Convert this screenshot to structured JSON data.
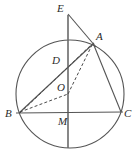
{
  "figure": {
    "type": "euclidean-geometry-diagram",
    "canvas": {
      "width": 136,
      "height": 164
    },
    "stroke_color": "#555555",
    "label_color": "#2b2b2b",
    "background_color": "#ffffff",
    "circle": {
      "cx": 70,
      "cy": 94,
      "r": 54
    },
    "points": [
      {
        "id": "E",
        "label": "E",
        "x": 68,
        "y": 15,
        "label_x": 57,
        "label_y": 3,
        "on_circle": false
      },
      {
        "id": "A",
        "label": "A",
        "x": 93,
        "y": 43,
        "label_x": 96,
        "label_y": 31,
        "on_circle": true
      },
      {
        "id": "D",
        "label": "D",
        "x": 62,
        "y": 67,
        "label_x": 52,
        "label_y": 55,
        "on_circle": false
      },
      {
        "id": "O",
        "label": "O",
        "x": 68,
        "y": 94,
        "label_x": 57,
        "label_y": 82,
        "on_circle": false
      },
      {
        "id": "B",
        "label": "B",
        "x": 19,
        "y": 113,
        "label_x": 5,
        "label_y": 108,
        "on_circle": true
      },
      {
        "id": "M",
        "label": "M",
        "x": 68,
        "y": 113,
        "label_x": 58,
        "label_y": 116,
        "on_circle": false
      },
      {
        "id": "C",
        "label": "C",
        "x": 121,
        "y": 112,
        "label_x": 124,
        "label_y": 108,
        "on_circle": true
      }
    ],
    "solid_segments": [
      {
        "name": "segment-EM",
        "from": "E",
        "to": "bottom-of-circle",
        "x1": 68,
        "y1": 15,
        "x2": 68,
        "y2": 148
      },
      {
        "name": "segment-EA",
        "from": "E",
        "to": "A",
        "x1": 68,
        "y1": 15,
        "x2": 95,
        "y2": 46
      },
      {
        "name": "segment-BC",
        "from": "B",
        "to": "C",
        "x1": 17,
        "y1": 113,
        "x2": 122,
        "y2": 112
      },
      {
        "name": "segment-BA",
        "from": "B",
        "to": "A",
        "x1": 19,
        "y1": 113,
        "x2": 93,
        "y2": 43
      },
      {
        "name": "segment-AC",
        "from": "A",
        "to": "C",
        "x1": 93,
        "y1": 43,
        "x2": 121,
        "y2": 112
      }
    ],
    "dashed_segments": [
      {
        "name": "segment-BO",
        "from": "B",
        "to": "O",
        "x1": 19,
        "y1": 113,
        "x2": 68,
        "y2": 94
      },
      {
        "name": "segment-OA",
        "from": "O",
        "to": "A",
        "x1": 68,
        "y1": 94,
        "x2": 93,
        "y2": 43
      },
      {
        "name": "segment-BA-dashed",
        "from": "B",
        "to": "A",
        "x1": 19,
        "y1": 113,
        "x2": 92,
        "y2": 44
      }
    ],
    "labels": {
      "E": "E",
      "A": "A",
      "D": "D",
      "O": "O",
      "B": "B",
      "M": "M",
      "C": "C"
    }
  }
}
